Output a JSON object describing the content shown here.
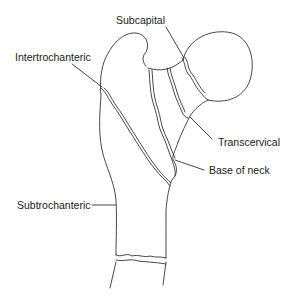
{
  "diagram": {
    "line_color": "#333333",
    "background": "#ffffff",
    "labels": [
      {
        "id": "subcapital",
        "text": "Subcapital"
      },
      {
        "id": "intertrochanteric",
        "text": "Intertrochanteric"
      },
      {
        "id": "transcervical",
        "text": "Transcervical"
      },
      {
        "id": "base_of_neck",
        "text": "Base of neck"
      },
      {
        "id": "subtrochanteric",
        "text": "Subtrochanteric"
      }
    ]
  }
}
